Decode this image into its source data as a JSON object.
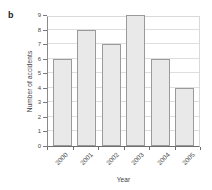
{
  "figure": {
    "panel_label": "b",
    "background_color": "#ffffff"
  },
  "chart_data": {
    "type": "bar",
    "title": "",
    "categories": [
      "2000",
      "2001",
      "2002",
      "2003",
      "2004",
      "2005"
    ],
    "values": [
      6,
      8,
      7,
      9,
      6,
      4
    ],
    "series": [
      {
        "name": "Number of accidents",
        "values": [
          6,
          8,
          7,
          9,
          6,
          4
        ]
      }
    ],
    "xlabel": "Year",
    "ylabel": "Number of accidents",
    "ylim": [
      0,
      9
    ],
    "ytick_labels": [
      "0",
      "1",
      "2",
      "3",
      "4",
      "5",
      "6",
      "7",
      "8",
      "9"
    ],
    "ytick_values": [
      0,
      1,
      2,
      3,
      4,
      5,
      6,
      7,
      8,
      9
    ],
    "xtick_labels": [
      "2000",
      "2001",
      "2002",
      "2003",
      "2004",
      "2005"
    ],
    "xtick_rotation": -45,
    "grid": true,
    "grid_axis": "y",
    "legend": false,
    "legend_position": "none",
    "bar_fill_color": "#e9e9e9",
    "bar_edge_color": "#9a9a9a",
    "grid_color": "#dedede",
    "axis_color": "#6e6e6e"
  }
}
